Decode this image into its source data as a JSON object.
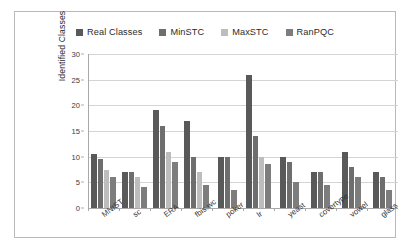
{
  "chart_data": {
    "type": "bar",
    "title": "",
    "xlabel": "",
    "ylabel": "Identified Classes",
    "ylim": [
      0,
      30
    ],
    "yticks": [
      0,
      5,
      10,
      15,
      20,
      25,
      30
    ],
    "grid": true,
    "legend_position": "top",
    "categories": [
      "MNIST",
      "sc",
      "ERA",
      "fbis.wc",
      "poker",
      "lr",
      "yeast",
      "covertype",
      "vowel",
      "glass"
    ],
    "series": [
      {
        "name": "Real Classes",
        "color": "#595959",
        "values": [
          10.5,
          7,
          19,
          17,
          10,
          26,
          10,
          7,
          11,
          7
        ]
      },
      {
        "name": "MinSTC",
        "color": "#6e6e6e",
        "values": [
          9.5,
          7,
          16,
          10,
          10,
          14,
          9,
          7,
          8,
          6
        ]
      },
      {
        "name": "MaxSTC",
        "color": "#bdbdbd",
        "values": [
          7.5,
          6,
          11,
          7,
          0,
          10,
          0,
          0,
          0,
          0
        ]
      },
      {
        "name": "RanPQC",
        "color": "#7d7d7d",
        "values": [
          6,
          4,
          9,
          4.5,
          3.5,
          8.5,
          5,
          4.5,
          6,
          3.5
        ]
      }
    ]
  },
  "legend": {
    "items": [
      {
        "label": "Real Classes",
        "color": "#595959"
      },
      {
        "label": "MinSTC",
        "color": "#6e6e6e"
      },
      {
        "label": "MaxSTC",
        "color": "#bdbdbd"
      },
      {
        "label": "RanPQC",
        "color": "#7d7d7d"
      }
    ]
  },
  "axis": {
    "y_title": "Identified Classes",
    "y_tick_labels": [
      "0",
      "5",
      "10",
      "15",
      "20",
      "25",
      "30"
    ]
  }
}
